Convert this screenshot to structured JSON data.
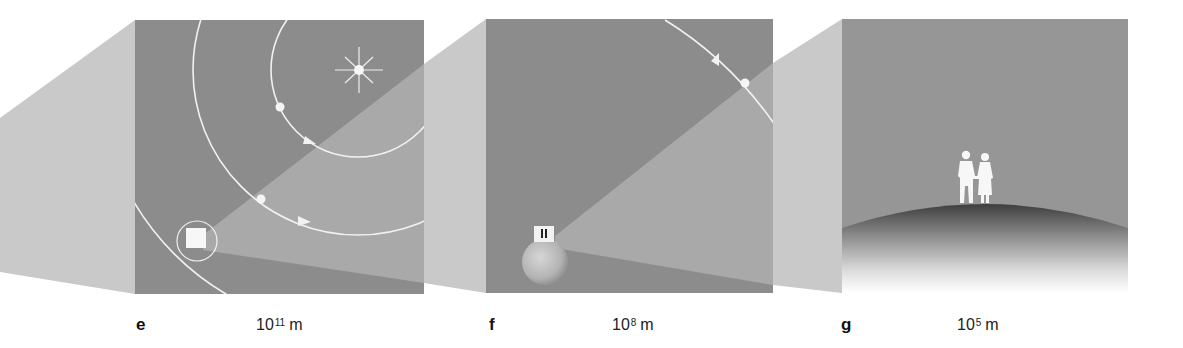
{
  "figure": {
    "colors": {
      "background": "#ffffff",
      "panel_dark": "#8c8c8c",
      "funnel_light": "#c9c9c9",
      "beam": "#a9a9a9",
      "orbit_line": "#f2f2f2",
      "sky_g": "#969696",
      "ground_dark": "#4a4a4a"
    },
    "panels": [
      {
        "letter": "e",
        "scale_base": "10",
        "scale_exponent": "11",
        "scale_unit": "m",
        "contents": [
          "sun-icon",
          "orbit-inner",
          "orbit-middle",
          "orbit-outer",
          "planet-dot",
          "earth-dot",
          "earth-highlight-box",
          "moon-orbit-circle"
        ]
      },
      {
        "letter": "f",
        "scale_base": "10",
        "scale_exponent": "8",
        "scale_unit": "m",
        "contents": [
          "moon-orbit-arc",
          "moon-dot",
          "earth-globe",
          "people-highlight-box"
        ]
      },
      {
        "letter": "g",
        "scale_base": "10",
        "scale_exponent": "5",
        "scale_unit": "m",
        "contents": [
          "two-people-silhouette",
          "earth-horizon-hill"
        ]
      }
    ]
  }
}
